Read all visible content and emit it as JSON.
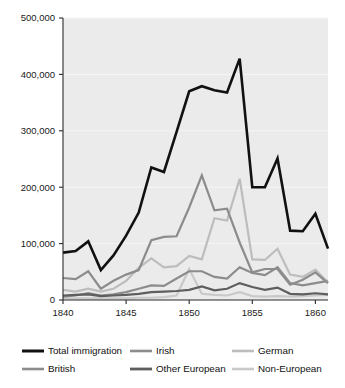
{
  "chart_data": {
    "type": "line",
    "title": "",
    "subtitle": "",
    "xlabel": "",
    "ylabel": "",
    "xlim": [
      1840,
      1861
    ],
    "ylim": [
      0,
      500000
    ],
    "grid": true,
    "legend_position": "bottom",
    "x_ticks": [
      "1840",
      "1845",
      "1850",
      "1855",
      "1860"
    ],
    "x_tick_values": [
      1840,
      1845,
      1850,
      1855,
      1860
    ],
    "y_ticks": [
      "0",
      "100,000",
      "200,000",
      "300,000",
      "400,000",
      "500,000"
    ],
    "y_tick_values": [
      0,
      100000,
      200000,
      300000,
      400000,
      500000
    ],
    "x": [
      1840,
      1841,
      1842,
      1843,
      1844,
      1845,
      1846,
      1847,
      1848,
      1849,
      1850,
      1851,
      1852,
      1853,
      1854,
      1855,
      1856,
      1857,
      1858,
      1859,
      1860,
      1861
    ],
    "series": [
      {
        "name": "Total immigration",
        "color": "#111111",
        "width": 2.6,
        "values": [
          84000,
          87000,
          104000,
          53000,
          79000,
          114000,
          155000,
          235000,
          227000,
          298000,
          370000,
          379000,
          372000,
          368000,
          428000,
          200000,
          200000,
          251000,
          123000,
          122000,
          153000,
          91000
        ]
      },
      {
        "name": "Irish",
        "color": "#8c8c8c",
        "width": 2.2,
        "values": [
          39000,
          37000,
          51000,
          20000,
          34000,
          45000,
          53000,
          106000,
          112000,
          113000,
          164000,
          221000,
          159000,
          162000,
          102000,
          49000,
          55000,
          55000,
          27000,
          36000,
          49000,
          30000
        ]
      },
      {
        "name": "German",
        "color": "#bdbdbd",
        "width": 2.2,
        "values": [
          18000,
          15000,
          20000,
          15000,
          20000,
          34000,
          57000,
          74000,
          58000,
          60000,
          78000,
          72000,
          145000,
          141000,
          215000,
          72000,
          71000,
          91000,
          45000,
          41000,
          54000,
          31000
        ]
      },
      {
        "name": "British",
        "color": "#8c8c8c",
        "width": 2.2,
        "values": [
          6000,
          8000,
          12000,
          8000,
          10000,
          14000,
          20000,
          26000,
          25000,
          38000,
          51000,
          51000,
          41000,
          38000,
          58000,
          48000,
          44000,
          58000,
          30000,
          26000,
          30000,
          34000
        ]
      },
      {
        "name": "Other European",
        "color": "#5e5e5e",
        "width": 2.2,
        "values": [
          8000,
          9000,
          10000,
          7000,
          8000,
          9000,
          11000,
          14000,
          15000,
          16000,
          18000,
          24000,
          17000,
          20000,
          30000,
          23000,
          18000,
          22000,
          11000,
          10000,
          12000,
          10000
        ]
      },
      {
        "name": "Non-European",
        "color": "#c9c9c9",
        "width": 2.2,
        "values": [
          3000,
          3000,
          3000,
          3000,
          3000,
          3000,
          4000,
          4000,
          5000,
          8000,
          55000,
          11000,
          9000,
          8000,
          14000,
          7000,
          6000,
          7000,
          6000,
          7000,
          8000,
          9000
        ]
      }
    ]
  },
  "legend": {
    "entries": [
      {
        "label": "Total immigration",
        "color": "#111111",
        "width": 3.0
      },
      {
        "label": "Irish",
        "color": "#8c8c8c",
        "width": 2.6
      },
      {
        "label": "German",
        "color": "#bdbdbd",
        "width": 2.6
      },
      {
        "label": "British",
        "color": "#8c8c8c",
        "width": 2.6
      },
      {
        "label": "Other European",
        "color": "#5e5e5e",
        "width": 2.8
      },
      {
        "label": "Non-European",
        "color": "#c9c9c9",
        "width": 2.6
      }
    ]
  },
  "colors": {
    "plot_background": "#ebebeb",
    "page_background": "#ffffff",
    "axis": "#2b2b2b",
    "gridline": "#f6f6f6",
    "text": "#111111"
  }
}
